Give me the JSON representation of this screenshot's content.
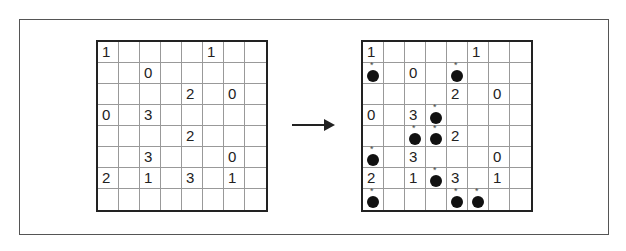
{
  "diagram": {
    "grid_size": [
      8,
      8
    ],
    "left_grid": {
      "rows": [
        [
          "1",
          "",
          "",
          "",
          "",
          "1",
          "",
          ""
        ],
        [
          "",
          "",
          "0",
          "",
          "",
          "",
          "",
          ""
        ],
        [
          "",
          "",
          "",
          "",
          "2",
          "",
          "0",
          ""
        ],
        [
          "0",
          "",
          "3",
          "",
          "",
          "",
          "",
          ""
        ],
        [
          "",
          "",
          "",
          "",
          "2",
          "",
          "",
          ""
        ],
        [
          "",
          "",
          "3",
          "",
          "",
          "",
          "0",
          ""
        ],
        [
          "2",
          "",
          "1",
          "",
          "3",
          "",
          "1",
          ""
        ],
        [
          "",
          "",
          "",
          "",
          "",
          "",
          "",
          ""
        ]
      ]
    },
    "right_grid": {
      "rows": [
        [
          "1",
          "",
          "",
          "",
          "",
          "1",
          "",
          ""
        ],
        [
          "",
          "",
          "0",
          "",
          "",
          "",
          "",
          ""
        ],
        [
          "",
          "",
          "",
          "",
          "2",
          "",
          "0",
          ""
        ],
        [
          "0",
          "",
          "3",
          "",
          "",
          "",
          "",
          ""
        ],
        [
          "",
          "",
          "",
          "",
          "2",
          "",
          "",
          ""
        ],
        [
          "",
          "",
          "3",
          "",
          "",
          "",
          "0",
          ""
        ],
        [
          "2",
          "",
          "1",
          "",
          "3",
          "",
          "1",
          ""
        ],
        [
          "",
          "",
          "",
          "",
          "",
          "",
          "",
          ""
        ]
      ],
      "bombs": [
        [
          1,
          0
        ],
        [
          1,
          4
        ],
        [
          3,
          3
        ],
        [
          4,
          2
        ],
        [
          4,
          3
        ],
        [
          5,
          0
        ],
        [
          6,
          3
        ],
        [
          7,
          0
        ],
        [
          7,
          4
        ],
        [
          7,
          5
        ]
      ],
      "bomb_icon": "bomb-icon"
    },
    "arrow": "right-arrow",
    "colors": {
      "grid_line": "#999999",
      "border": "#222222",
      "bomb": "#111111"
    }
  }
}
